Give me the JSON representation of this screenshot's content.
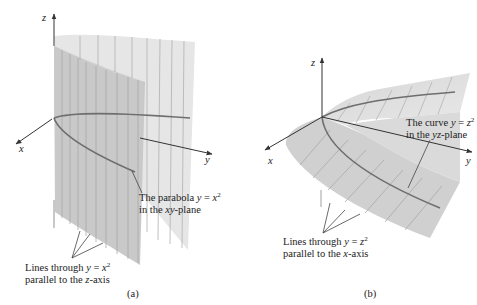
{
  "figure_a": {
    "caption": "(a)",
    "axes": {
      "x": "x",
      "y": "y",
      "z": "z"
    },
    "annotation_parabola": {
      "line1_prefix": "The parabola ",
      "var_y": "y",
      "eq": " = ",
      "var_x": "x",
      "exp": "2",
      "line2_prefix": "in the ",
      "plane": "xy",
      "line2_suffix": "-plane"
    },
    "annotation_lines": {
      "line1_prefix": "Lines through ",
      "var_y": "y",
      "eq": " = ",
      "var_x": "x",
      "exp": "2",
      "line2_prefix": "parallel to the ",
      "axis": "z",
      "line2_suffix": "-axis"
    }
  },
  "figure_b": {
    "caption": "(b)",
    "axes": {
      "x": "x",
      "y": "y",
      "z": "z"
    },
    "annotation_curve": {
      "line1_prefix": "The curve ",
      "var_y": "y",
      "eq": " = ",
      "var_z": "z",
      "exp": "2",
      "line2_prefix": "in the ",
      "plane": "yz",
      "line2_suffix": "-plane"
    },
    "annotation_lines": {
      "line1_prefix": "Lines through ",
      "var_y": "y",
      "eq": " = ",
      "var_z": "z",
      "exp": "2",
      "line2_prefix": "parallel to the ",
      "axis": "x",
      "line2_suffix": "-axis"
    }
  },
  "colors": {
    "surface_front": "#c8c8c8",
    "surface_back": "#e4e4e4",
    "curve": "#6e6e6e",
    "axis": "#333333"
  }
}
